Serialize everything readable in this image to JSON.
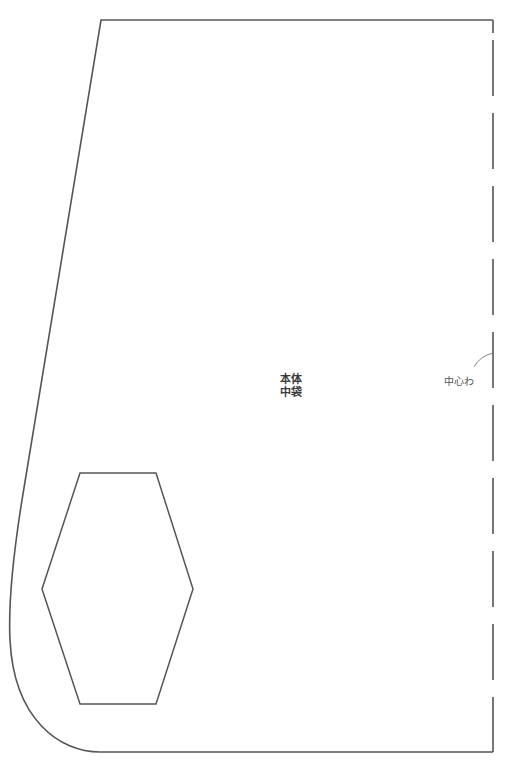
{
  "pattern": {
    "piece_name_line1": "本体",
    "piece_name_line2": "中袋",
    "center_fold_label": "中心わ",
    "colors": {
      "outline": "#555555",
      "text": "#3a3a3a",
      "background": "#ffffff"
    },
    "outline": {
      "top_left": [
        101,
        20
      ],
      "top_right": [
        493,
        20
      ],
      "bottom_right": [
        493,
        752
      ],
      "bottom_left_curve_end": [
        100,
        752
      ]
    },
    "fold_line": {
      "x": 493,
      "style": "dashed",
      "dash_length": 55,
      "gap_length": 17
    },
    "hexagon_cutout": {
      "vertices": [
        [
          80,
          473
        ],
        [
          156,
          473
        ],
        [
          193,
          589
        ],
        [
          156,
          704
        ],
        [
          80,
          704
        ],
        [
          42,
          589
        ]
      ]
    }
  }
}
